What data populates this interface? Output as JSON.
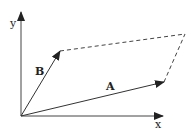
{
  "diagram": {
    "axes": {
      "x_label": "x",
      "y_label": "y"
    },
    "vectors": [
      {
        "name": "A",
        "label": "A",
        "from": [
          21,
          116
        ],
        "to": [
          164,
          82
        ]
      },
      {
        "name": "B",
        "label": "B",
        "from": [
          21,
          116
        ],
        "to": [
          60,
          51
        ]
      }
    ],
    "dashed_edges": [
      {
        "from": [
          60,
          51
        ],
        "to": [
          185,
          34
        ]
      },
      {
        "from": [
          164,
          82
        ],
        "to": [
          185,
          34
        ]
      }
    ],
    "colors": {
      "line": "#333333",
      "background": "#ffffff"
    }
  }
}
